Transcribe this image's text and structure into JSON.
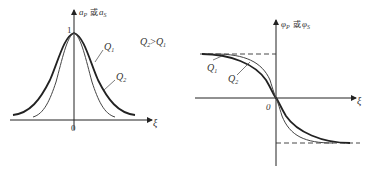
{
  "figure": {
    "note": "Q₂ > Q₁",
    "note_parts": {
      "lhs": "Q",
      "lhs_sub": "2",
      "op": ">",
      "rhs": "Q",
      "rhs_sub": "1"
    }
  },
  "left_panel": {
    "y_axis_label": {
      "a": "a",
      "a_sub": "P",
      "joiner": "或",
      "b": "a",
      "b_sub": "S"
    },
    "x_axis_label": "ξ",
    "origin_label": "0",
    "peak_label": "1",
    "curves": [
      {
        "name": "Q",
        "sub": "1",
        "style": "thick",
        "description": "wider bell curve"
      },
      {
        "name": "Q",
        "sub": "2",
        "style": "thin",
        "description": "narrower bell curve"
      }
    ]
  },
  "right_panel": {
    "y_axis_label": {
      "a": "φ",
      "a_sub": "P",
      "joiner": "或",
      "b": "φ",
      "b_sub": "S"
    },
    "x_axis_label": "ξ",
    "origin_label": "0",
    "curves": [
      {
        "name": "Q",
        "sub": "1",
        "style": "thick",
        "description": "gentler sigmoid"
      },
      {
        "name": "Q",
        "sub": "2",
        "style": "thin",
        "description": "steeper sigmoid"
      }
    ],
    "asymptotes": [
      "upper dashed",
      "lower dashed"
    ]
  },
  "colors": {
    "line": "#222222",
    "thin_line": "#444444",
    "background": "#ffffff"
  }
}
